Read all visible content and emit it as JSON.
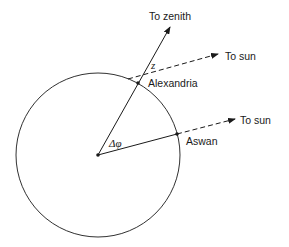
{
  "diagram": {
    "labels": {
      "zenith": "To zenith",
      "sun_top": "To sun",
      "sun_bottom": "To sun",
      "alexandria": "Alexandria",
      "aswan": "Aswan",
      "angle_z": "z",
      "angle_dphi": "Δφ"
    },
    "colors": {
      "stroke": "#1a1a1a",
      "background": "#ffffff"
    }
  }
}
